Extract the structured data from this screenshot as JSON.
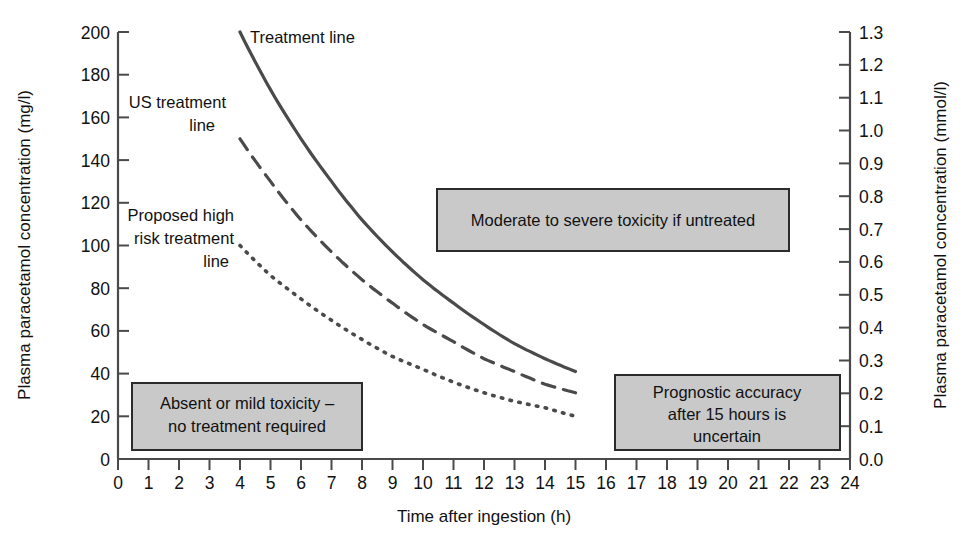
{
  "chart_data": {
    "type": "line",
    "title": "",
    "xlabel": "Time after ingestion (h)",
    "ylabel": "Plasma paracetamol concentration (mg/l)",
    "ylabel_right": "Plasma paracetamol concentration (mmol/l)",
    "xlim": [
      0,
      24
    ],
    "ylim": [
      0,
      200
    ],
    "ylim_right": [
      0.0,
      1.3
    ],
    "grid": false,
    "legend": "inline-labels",
    "xticks": [
      0,
      1,
      2,
      3,
      4,
      5,
      6,
      7,
      8,
      9,
      10,
      11,
      12,
      13,
      14,
      15,
      16,
      17,
      18,
      19,
      20,
      21,
      22,
      23,
      24
    ],
    "xtick_labels": [
      "0",
      "1",
      "2",
      "3",
      "4",
      "5",
      "6",
      "7",
      "8",
      "9",
      "10",
      "11",
      "12",
      "13",
      "14",
      "15",
      "16",
      "17",
      "18",
      "19",
      "20",
      "21",
      "22",
      "23",
      "24"
    ],
    "yticks": [
      0,
      20,
      40,
      60,
      80,
      100,
      120,
      140,
      160,
      180,
      200
    ],
    "ytick_labels": [
      "0",
      "20",
      "40",
      "60",
      "80",
      "100",
      "120",
      "140",
      "160",
      "180",
      "200"
    ],
    "yticks_right": [
      0.0,
      0.1,
      0.2,
      0.3,
      0.4,
      0.5,
      0.6,
      0.7,
      0.8,
      0.9,
      1.0,
      1.1,
      1.2,
      1.3
    ],
    "ytick_labels_right": [
      "0.0",
      "0.1",
      "0.2",
      "0.3",
      "0.4",
      "0.5",
      "0.6",
      "0.7",
      "0.8",
      "0.9",
      "1.0",
      "1.1",
      "1.2",
      "1.3"
    ],
    "series": [
      {
        "name": "Treatment line",
        "style": "solid",
        "x": [
          4,
          5,
          6,
          7,
          8,
          9,
          10,
          11,
          12,
          13,
          14,
          15
        ],
        "values": [
          200,
          173,
          150,
          130,
          112,
          97,
          84,
          73,
          63,
          54,
          47,
          41
        ]
      },
      {
        "name": "US treatment line",
        "style": "dashed",
        "x": [
          4,
          5,
          6,
          7,
          8,
          9,
          10,
          11,
          12,
          13,
          14,
          15
        ],
        "values": [
          150,
          130,
          112,
          97,
          84,
          73,
          63,
          55,
          47,
          41,
          35,
          31
        ]
      },
      {
        "name": "Proposed high risk treatment line",
        "style": "dotted",
        "x": [
          4,
          5,
          6,
          7,
          8,
          9,
          10,
          11,
          12,
          13,
          14,
          15
        ],
        "values": [
          100,
          86,
          75,
          65,
          56,
          48,
          42,
          36,
          31,
          27,
          24,
          20
        ]
      }
    ],
    "annotations": [
      {
        "text": "Moderate to severe toxicity if untreated",
        "lines": [
          "Moderate to severe toxicity if untreated"
        ]
      },
      {
        "text": "Absent or mild toxicity – no treatment required",
        "lines": [
          "Absent or mild toxicity –",
          "no treatment required"
        ]
      },
      {
        "text": "Prognostic accuracy after 15 hours is uncertain",
        "lines": [
          "Prognostic accuracy",
          "after 15 hours is",
          "uncertain"
        ]
      }
    ]
  },
  "axes": {
    "left_title": "Plasma paracetamol concentration (mg/l)",
    "right_title": "Plasma paracetamol concentration (mmol/l)",
    "bottom_title": "Time after ingestion (h)"
  },
  "curve_labels": {
    "treatment": "Treatment line",
    "us_line_1": "US treatment",
    "us_line_2": "line",
    "high_risk_1": "Proposed high",
    "high_risk_2": "risk treatment",
    "high_risk_3": "line"
  },
  "boxes": {
    "moderate": {
      "line1": "Moderate to severe toxicity if untreated"
    },
    "absent": {
      "line1": "Absent or mild toxicity –",
      "line2": "no treatment required"
    },
    "prognostic": {
      "line1": "Prognostic accuracy",
      "line2": "after 15 hours is",
      "line3": "uncertain"
    }
  },
  "colors": {
    "box_fill": "#c9c9c9",
    "box_border": "#2b2b2b",
    "curve": "#4a4a4a",
    "text": "#111111",
    "background": "#ffffff"
  }
}
